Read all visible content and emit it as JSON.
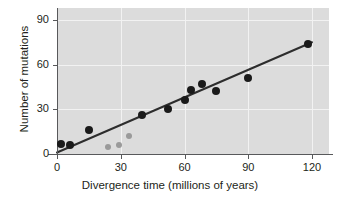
{
  "chart_data": {
    "type": "scatter",
    "title": "",
    "xlabel": "Divergence time (millions of years)",
    "ylabel": "Number of mutations",
    "xlim": [
      0,
      128
    ],
    "ylim": [
      0,
      98
    ],
    "xticks": [
      0,
      30,
      60,
      90,
      120
    ],
    "xticklabels": [
      "0",
      "30",
      "60",
      "90",
      "120"
    ],
    "yticks": [
      0,
      30,
      60,
      90
    ],
    "yticklabels": [
      "0",
      "30",
      "60",
      "90"
    ],
    "grid": true,
    "grid_color": "#f2f2f2",
    "plot_background": "#dcdcdc",
    "legend": null,
    "series": [
      {
        "name": "primary-points",
        "marker": "circle",
        "color": "#1a1a1a",
        "points": [
          {
            "x": 2,
            "y": 7
          },
          {
            "x": 6,
            "y": 6
          },
          {
            "x": 15,
            "y": 16
          },
          {
            "x": 40,
            "y": 26
          },
          {
            "x": 52,
            "y": 30
          },
          {
            "x": 60,
            "y": 36
          },
          {
            "x": 63,
            "y": 43
          },
          {
            "x": 68,
            "y": 47
          },
          {
            "x": 75,
            "y": 42
          },
          {
            "x": 90,
            "y": 51
          },
          {
            "x": 118,
            "y": 74
          }
        ]
      },
      {
        "name": "outlier-points",
        "marker": "circle",
        "color": "#9a9a9a",
        "points": [
          {
            "x": 24,
            "y": 5
          },
          {
            "x": 29,
            "y": 6
          },
          {
            "x": 34,
            "y": 12
          }
        ]
      }
    ],
    "trendline": {
      "name": "regression-line",
      "color": "#2d2d2d",
      "x0": 0,
      "y0": 1,
      "x1": 120,
      "y1": 75
    }
  },
  "axes": {
    "x": {
      "label": "Divergence time (millions of years)",
      "tick_labels": [
        "0",
        "30",
        "60",
        "90",
        "120"
      ]
    },
    "y": {
      "label": "Number of mutations",
      "tick_labels": [
        "0",
        "30",
        "60",
        "90"
      ]
    }
  }
}
